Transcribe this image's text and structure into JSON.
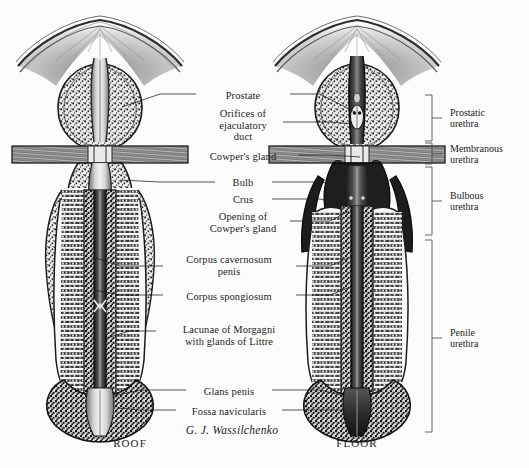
{
  "figure": {
    "kind": "anatomical-illustration",
    "background_color": "#fcfcfc",
    "ink_color": "#1c1c1c"
  },
  "signature": "G. J. Wassilchenko",
  "panels": [
    {
      "id": "roof",
      "caption": "ROOF",
      "cx": 130,
      "cy": 444
    },
    {
      "id": "floor",
      "caption": "FLOOR",
      "cx": 357,
      "cy": 444
    }
  ],
  "labels": [
    {
      "id": "prostate",
      "text": "Prostate",
      "x": 243,
      "y": 90,
      "align": "c"
    },
    {
      "id": "orifices",
      "text": "Orifices of\nejaculatory\nduct",
      "x": 243,
      "y": 108,
      "align": "c"
    },
    {
      "id": "cowpers-gland",
      "text": "Cowper's gland",
      "x": 243,
      "y": 151,
      "align": "c"
    },
    {
      "id": "bulb",
      "text": "Bulb",
      "x": 243,
      "y": 177,
      "align": "c"
    },
    {
      "id": "crus",
      "text": "Crus",
      "x": 243,
      "y": 194,
      "align": "c"
    },
    {
      "id": "opening-cowpers",
      "text": "Opening of\nCowper's gland",
      "x": 243,
      "y": 211,
      "align": "c"
    },
    {
      "id": "corpus-cavernosum",
      "text": "Corpus cavernosum\npenis",
      "x": 229,
      "y": 254,
      "align": "c"
    },
    {
      "id": "corpus-spongiosum",
      "text": "Corpus spongiosum",
      "x": 229,
      "y": 291,
      "align": "c"
    },
    {
      "id": "lacunae-morgagni",
      "text": "Lacunae of Morgagni\nwith glands of Littre",
      "x": 229,
      "y": 324,
      "align": "c"
    },
    {
      "id": "glans-penis",
      "text": "Glans penis",
      "x": 229,
      "y": 386,
      "align": "c"
    },
    {
      "id": "fossa-navicularis",
      "text": "Fossa navicularis",
      "x": 229,
      "y": 406,
      "align": "c"
    }
  ],
  "bracket_labels": [
    {
      "id": "prostatic-urethra",
      "text": "Prostatic\nurethra",
      "x": 450,
      "y": 107,
      "top": 95,
      "bottom": 141,
      "tick": 118
    },
    {
      "id": "membranous-urethra",
      "text": "Membranous\nurethra",
      "x": 450,
      "y": 143,
      "top": 143,
      "bottom": 164,
      "tick": 154
    },
    {
      "id": "bulbous-urethra",
      "text": "Bulbous\nurethra",
      "x": 450,
      "y": 190,
      "top": 167,
      "bottom": 235,
      "tick": 201
    },
    {
      "id": "penile-urethra",
      "text": "Penile\nurethra",
      "x": 450,
      "y": 327,
      "top": 240,
      "bottom": 432,
      "tick": 338
    }
  ],
  "leaders": [
    {
      "id": "leader-prostate-roof",
      "points": "196,94 160,94 122,107"
    },
    {
      "id": "leader-prostate-floor",
      "points": "290,94 320,94 355,112"
    },
    {
      "id": "leader-orifices",
      "points": "283,122 330,122 352,124"
    },
    {
      "id": "leader-cowpers-gland",
      "points": "298,155 330,155 360,157"
    },
    {
      "id": "leader-bulb-roof",
      "points": "215,182 160,182 120,180"
    },
    {
      "id": "leader-bulb-floor",
      "points": "272,182 320,182 347,186"
    },
    {
      "id": "leader-crus",
      "points": "272,199 320,199 338,203"
    },
    {
      "id": "leader-opening-cowpers",
      "points": "290,221 330,221 349,211"
    },
    {
      "id": "leader-cc-roof",
      "points": "163,266 120,266 96,258"
    },
    {
      "id": "leader-cc-floor",
      "points": "296,266 330,266 348,258"
    },
    {
      "id": "leader-cs-roof",
      "points": "163,295 120,295 94,290"
    },
    {
      "id": "leader-cs-floor",
      "points": "296,295 330,295 348,288"
    },
    {
      "id": "leader-lacunae",
      "points": "156,331 130,331 106,338"
    },
    {
      "id": "leader-glans-roof",
      "points": "186,390 140,390 114,396"
    },
    {
      "id": "leader-glans-floor",
      "points": "272,390 320,390 344,396"
    },
    {
      "id": "leader-fossa-roof",
      "points": "176,410 140,410 118,408"
    },
    {
      "id": "leader-fossa-floor",
      "points": "282,410 320,410 345,410"
    }
  ]
}
